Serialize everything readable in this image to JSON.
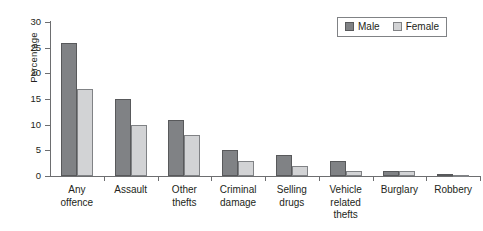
{
  "chart_data": {
    "type": "bar",
    "title": "",
    "xlabel": "",
    "ylabel": "Percentage",
    "ylim": [
      0,
      30
    ],
    "yticks": [
      0,
      5,
      10,
      15,
      20,
      25,
      30
    ],
    "ytick_labels": [
      "0",
      "5",
      "10",
      "15",
      "20",
      "25",
      "30"
    ],
    "grid": false,
    "legend_position": "top-right",
    "categories": [
      "Any offence",
      "Assault",
      "Other thefts",
      "Criminal damage",
      "Selling drugs",
      "Vehicle related thefts",
      "Burglary",
      "Robbery"
    ],
    "category_lines": [
      [
        "Any",
        "offence"
      ],
      [
        "Assault"
      ],
      [
        "Other",
        "thefts"
      ],
      [
        "Criminal",
        "damage"
      ],
      [
        "Selling",
        "drugs"
      ],
      [
        "Vehicle",
        "related",
        "thefts"
      ],
      [
        "Burglary"
      ],
      [
        "Robbery"
      ]
    ],
    "series": [
      {
        "name": "Male",
        "color": "#808285",
        "values": [
          26,
          15,
          11,
          5,
          4,
          3,
          1,
          0.3
        ]
      },
      {
        "name": "Female",
        "color": "#d2d3d5",
        "values": [
          17,
          10,
          8,
          3,
          2,
          1,
          1,
          0.2
        ]
      }
    ]
  },
  "legend": {
    "items": [
      {
        "label": "Male",
        "swatch": "male"
      },
      {
        "label": "Female",
        "swatch": "female"
      }
    ]
  }
}
